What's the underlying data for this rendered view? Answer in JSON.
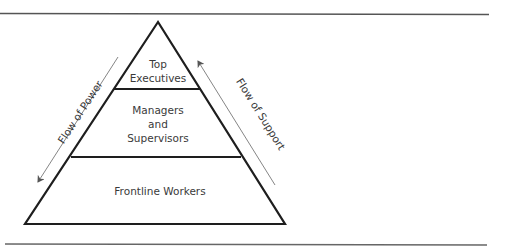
{
  "diagram": {
    "type": "pyramid",
    "levels": [
      {
        "label_line1": "Top",
        "label_line2": "Executives"
      },
      {
        "label_line1": "Managers",
        "label_line2": "and",
        "label_line3": "Supervisors"
      },
      {
        "label_line1": "Frontline Workers"
      }
    ],
    "arrows": {
      "left": {
        "label": "Flow of Power",
        "direction": "down"
      },
      "right": {
        "label": "Flow of Support",
        "direction": "up"
      }
    },
    "colors": {
      "outline": "#1e1e1e",
      "rule": "#555555",
      "arrow": "#666666",
      "text": "#3a3a3a"
    }
  }
}
